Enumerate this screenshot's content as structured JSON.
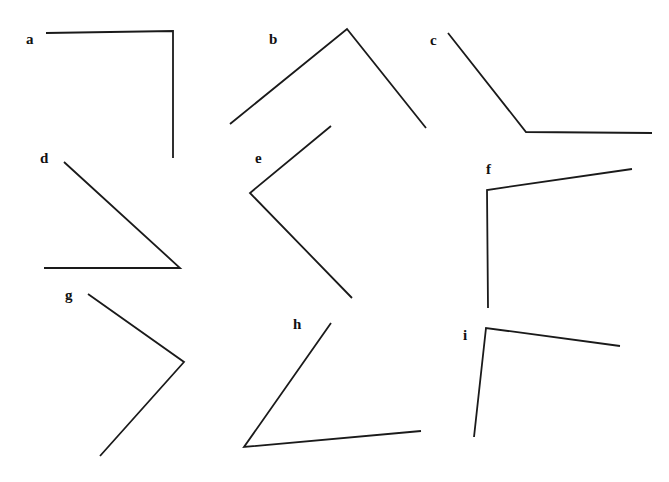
{
  "page": {
    "background_color": "#ffffff",
    "width": 669,
    "height": 482
  },
  "style": {
    "stroke_color": "#1a1a1a",
    "stroke_width": 1.8,
    "label_color": "#111111",
    "label_font_size": 15
  },
  "figures": [
    {
      "id": "a",
      "label": "a",
      "label_x": 26,
      "label_y": 32,
      "vertex": {
        "x": 173,
        "y": 31
      },
      "arm1_end": {
        "x": 46,
        "y": 33
      },
      "arm2_end": {
        "x": 173,
        "y": 158
      },
      "approx_angle_degrees": 90
    },
    {
      "id": "b",
      "label": "b",
      "label_x": 269,
      "label_y": 32,
      "vertex": {
        "x": 347,
        "y": 29
      },
      "arm1_end": {
        "x": 230,
        "y": 124
      },
      "arm2_end": {
        "x": 426,
        "y": 128
      },
      "approx_angle_degrees": 78
    },
    {
      "id": "c",
      "label": "c",
      "label_x": 430,
      "label_y": 33,
      "vertex": {
        "x": 526,
        "y": 132
      },
      "arm1_end": {
        "x": 448,
        "y": 33
      },
      "arm2_end": {
        "x": 652,
        "y": 133
      },
      "approx_angle_degrees": 128
    },
    {
      "id": "d",
      "label": "d",
      "label_x": 40,
      "label_y": 151,
      "vertex": {
        "x": 180,
        "y": 268
      },
      "arm1_end": {
        "x": 64,
        "y": 162
      },
      "arm2_end": {
        "x": 44,
        "y": 268
      },
      "approx_angle_degrees": 42
    },
    {
      "id": "e",
      "label": "e",
      "label_x": 255,
      "label_y": 151,
      "vertex": {
        "x": 250,
        "y": 193
      },
      "arm1_end": {
        "x": 331,
        "y": 126
      },
      "arm2_end": {
        "x": 352,
        "y": 298
      },
      "approx_angle_degrees": 85
    },
    {
      "id": "f",
      "label": "f",
      "label_x": 486,
      "label_y": 162,
      "vertex": {
        "x": 487,
        "y": 190
      },
      "arm1_end": {
        "x": 632,
        "y": 169
      },
      "arm2_end": {
        "x": 488,
        "y": 308
      },
      "approx_angle_degrees": 98
    },
    {
      "id": "g",
      "label": "g",
      "label_x": 65,
      "label_y": 288,
      "vertex": {
        "x": 184,
        "y": 362
      },
      "arm1_end": {
        "x": 88,
        "y": 294
      },
      "arm2_end": {
        "x": 100,
        "y": 456
      },
      "approx_angle_degrees": 83
    },
    {
      "id": "h",
      "label": "h",
      "label_x": 293,
      "label_y": 317,
      "vertex": {
        "x": 244,
        "y": 447
      },
      "arm1_end": {
        "x": 331,
        "y": 323
      },
      "arm2_end": {
        "x": 421,
        "y": 431
      },
      "approx_angle_degrees": 50
    },
    {
      "id": "i",
      "label": "i",
      "label_x": 463,
      "label_y": 328,
      "vertex": {
        "x": 486,
        "y": 328
      },
      "arm1_end": {
        "x": 620,
        "y": 346
      },
      "arm2_end": {
        "x": 474,
        "y": 437
      },
      "approx_angle_degrees": 90
    }
  ]
}
